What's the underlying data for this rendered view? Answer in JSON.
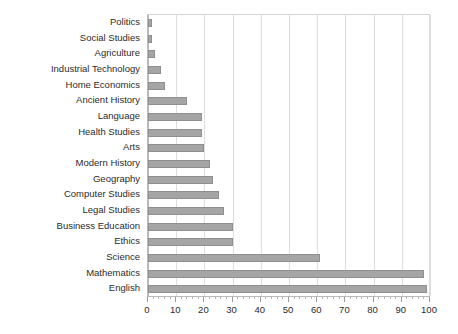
{
  "chart_data": {
    "type": "bar",
    "orientation": "horizontal",
    "title": "",
    "subtitle": "",
    "xlabel": "",
    "ylabel": "",
    "xlim": [
      0,
      100
    ],
    "xticks": [
      0,
      10,
      20,
      30,
      40,
      50,
      60,
      70,
      80,
      90,
      100
    ],
    "xtick_labels": [
      "0",
      "10",
      "20",
      "30",
      "40",
      "50",
      "60",
      "70",
      "80",
      "90",
      "100"
    ],
    "grid": true,
    "grid_axis": "x",
    "legend": false,
    "legend_position": "none",
    "bar_color": "#a5a5a5",
    "bar_edge_color": "#8f8f8f",
    "gridline_color": "#dedede",
    "axis_color": "#b9b9b9",
    "text_color": "#2b2b2b",
    "categories": [
      "Politics",
      "Social Studies",
      "Agriculture",
      "Industrial Technology",
      "Home Economics",
      "Ancient History",
      "Language",
      "Health Studies",
      "Arts",
      "Modern History",
      "Geography",
      "Computer Studies",
      "Legal Studies",
      "Business Education",
      "Ethics",
      "Science",
      "Mathematics",
      "English"
    ],
    "values": [
      1.5,
      1.5,
      2.5,
      4.5,
      6,
      14,
      19,
      19,
      20,
      22,
      23,
      25,
      27,
      30,
      30,
      61,
      98,
      99
    ]
  }
}
